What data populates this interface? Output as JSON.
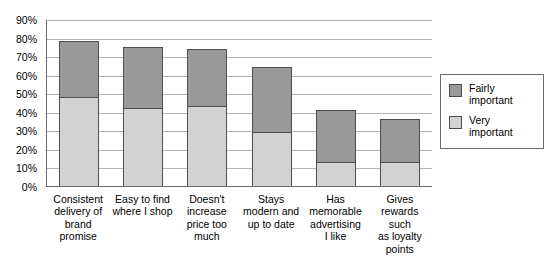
{
  "chart_data": {
    "type": "bar",
    "subtype": "stacked-column",
    "title": "",
    "xlabel": "",
    "ylabel": "",
    "ylim": [
      0,
      90
    ],
    "ytick_labels": [
      "90%",
      "80%",
      "70%",
      "60%",
      "50%",
      "40%",
      "30%",
      "20%",
      "10%",
      "0%"
    ],
    "ytick_values": [
      90,
      80,
      70,
      60,
      50,
      40,
      30,
      20,
      10,
      0
    ],
    "grid": true,
    "legend_position": "right",
    "categories": [
      "Consistent delivery of brand promise",
      "Easy to find where I shop",
      "Doesn't increase price too much",
      "Stays modern and up to date",
      "Has memorable advertising I like",
      "Gives rewards such as loyalty points"
    ],
    "series": [
      {
        "name": "Very important",
        "color": "#d2d2d2",
        "values": [
          48,
          42,
          43,
          29,
          13,
          13
        ]
      },
      {
        "name": "Fairly important",
        "color": "#999999",
        "values": [
          30,
          33,
          31,
          35,
          28,
          23
        ]
      }
    ],
    "totals": [
      78,
      75,
      74,
      64,
      41,
      36
    ]
  },
  "y_axis": {
    "ticks": [
      {
        "label": "90%"
      },
      {
        "label": "80%"
      },
      {
        "label": "70%"
      },
      {
        "label": "60%"
      },
      {
        "label": "50%"
      },
      {
        "label": "40%"
      },
      {
        "label": "30%"
      },
      {
        "label": "20%"
      },
      {
        "label": "10%"
      },
      {
        "label": "0%"
      }
    ]
  },
  "x_axis": {
    "labels": [
      {
        "text": "Consistent\ndelivery of\nbrand\npromise"
      },
      {
        "text": "Easy to find\nwhere I shop"
      },
      {
        "text": "Doesn't\nincrease\nprice too\nmuch"
      },
      {
        "text": "Stays\nmodern and\nup to date"
      },
      {
        "text": "Has\nmemorable\nadvertising\nI like"
      },
      {
        "text": "Gives\nrewards such\nas loyalty\npoints"
      }
    ]
  },
  "legend": {
    "items": [
      {
        "label": "Fairly\nimportant",
        "color": "#999999"
      },
      {
        "label": "Very\nimportant",
        "color": "#d2d2d2"
      }
    ]
  }
}
